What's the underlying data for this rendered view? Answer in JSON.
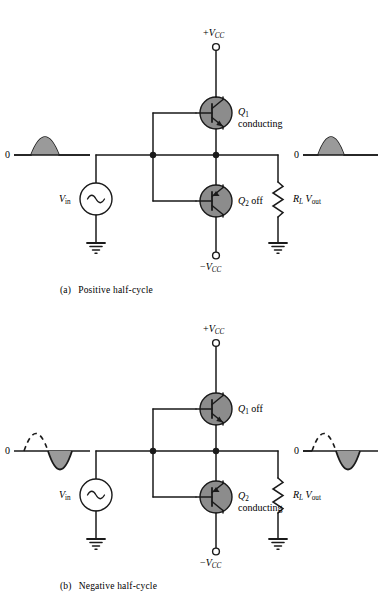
{
  "figure": {
    "panels": [
      {
        "id": "a",
        "caption_tag": "(a)",
        "caption_text": "Positive half-cycle",
        "supply_top": "+VCC",
        "supply_top_sign": "+",
        "supply_top_symbol": "V",
        "supply_top_sub": "CC",
        "supply_bottom_sign": "−",
        "supply_bottom_symbol": "V",
        "supply_bottom_sub": "CC",
        "source_label_symbol": "V",
        "source_label_sub": "in",
        "q1_name": "Q",
        "q1_sub": "1",
        "q1_state": "conducting",
        "q2_name": "Q",
        "q2_sub": "2",
        "q2_state": "off",
        "load_symbol": "R",
        "load_sub": "L",
        "out_symbol": "V",
        "out_sub": "out",
        "zero_label_in": "0",
        "zero_label_out": "0",
        "input_wave": "positive-half-solid",
        "output_wave": "positive-half-solid"
      },
      {
        "id": "b",
        "caption_tag": "(b)",
        "caption_text": "Negative half-cycle",
        "supply_top_sign": "+",
        "supply_top_symbol": "V",
        "supply_top_sub": "CC",
        "supply_bottom_sign": "−",
        "supply_bottom_symbol": "V",
        "supply_bottom_sub": "CC",
        "source_label_symbol": "V",
        "source_label_sub": "in",
        "q1_name": "Q",
        "q1_sub": "1",
        "q1_state": "off",
        "q2_name": "Q",
        "q2_sub": "2",
        "q2_state": "conducting",
        "load_symbol": "R",
        "load_sub": "L",
        "out_symbol": "V",
        "out_sub": "out",
        "zero_label_in": "0",
        "zero_label_out": "0",
        "input_wave": "negative-half-solid-positive-dashed",
        "output_wave": "negative-half-solid-positive-dashed"
      }
    ],
    "colors": {
      "wire": "#1a1a1a",
      "transistor_fill": "#8c8c8c",
      "wave_fill": "#9a9a9a",
      "background": "#ffffff",
      "text": "#000000"
    }
  }
}
